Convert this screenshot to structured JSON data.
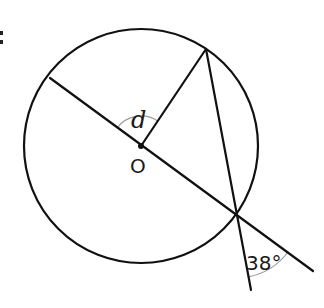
{
  "diagram": {
    "type": "circle-geometry",
    "colors": {
      "stroke": "#111111",
      "arc": "#999999",
      "text": "#1a1a1a"
    },
    "circle": {
      "center_label": "O",
      "cx": 141,
      "cy": 146,
      "r": 117
    },
    "points": {
      "O": [
        141,
        146
      ],
      "A_left_on_circle": [
        50,
        78
      ],
      "B_top_on_circle": [
        206,
        49
      ],
      "C_lower_right_on_circle": [
        236,
        213
      ],
      "D_diameter_extension_end": [
        313,
        271
      ],
      "E_chord_extension_end": [
        251,
        290
      ]
    },
    "segments": [
      {
        "name": "diameter-through-O-extended",
        "from": "A_left_on_circle",
        "to": "D_diameter_extension_end"
      },
      {
        "name": "radius-O-to-top",
        "from": "O",
        "to": "B_top_on_circle"
      },
      {
        "name": "chord-top-to-lower-right-extended",
        "from": "B_top_on_circle",
        "to": "E_chord_extension_end"
      }
    ],
    "labels": {
      "center": "O",
      "unknown_angle": "d",
      "given_angle": "38°"
    },
    "angles": [
      {
        "label": "d",
        "vertex": "O",
        "between": [
          "A_left_on_circle",
          "B_top_on_circle"
        ],
        "marked_with_arc": true
      },
      {
        "label": "38°",
        "vertex": "C_lower_right_on_circle",
        "between": [
          "E_chord_extension_end",
          "D_diameter_extension_end"
        ],
        "marked_with_arc": true
      }
    ],
    "cropped_glyph": ":"
  }
}
